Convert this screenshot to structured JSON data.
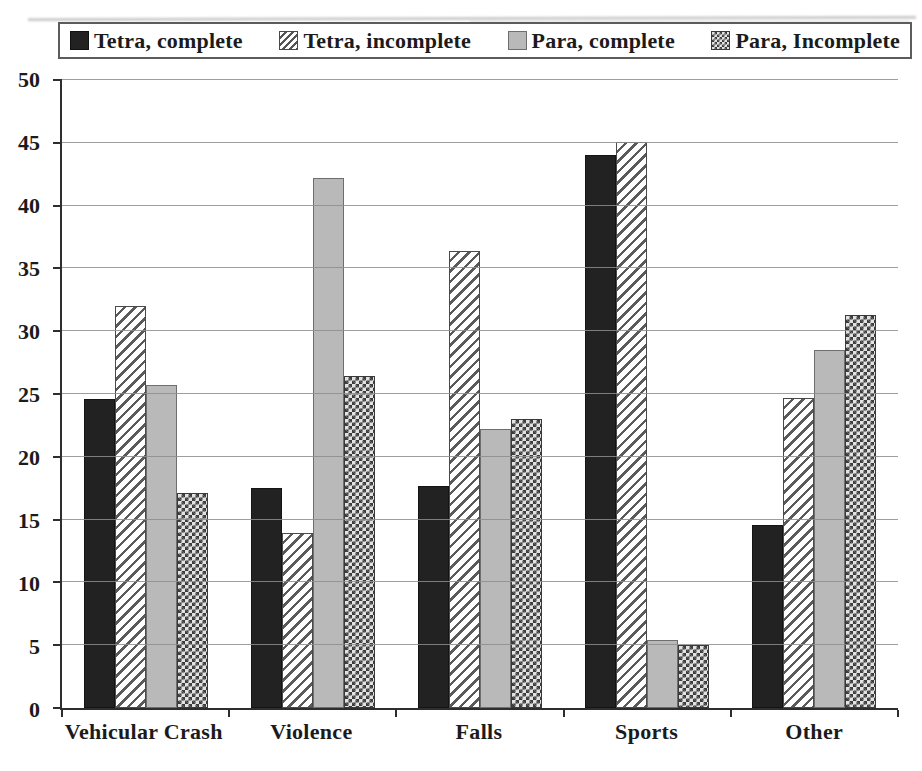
{
  "figure": {
    "background": "#ffffff",
    "kind": "scanned-grouped-bar-chart"
  },
  "colors": {
    "bar_solid": "#222222",
    "bar_hatch_line": "#5a5a5a",
    "bar_gray": "#b9b9b9",
    "bar_checker_dark": "#3c3c3c",
    "bar_checker_light": "#e2e2e2",
    "gridline": "#8d8d8d",
    "axis": "#2e2e2e",
    "text": "#1b1b1b",
    "legend_border": "#5c5c5c"
  },
  "chart_data": {
    "type": "bar",
    "title": "",
    "xlabel": "",
    "ylabel": "",
    "categories": [
      "Vehicular Crash",
      "Violence",
      "Falls",
      "Sports",
      "Other"
    ],
    "series": [
      {
        "name": "Tetra, complete",
        "pattern": "solid",
        "values": [
          24.6,
          17.5,
          17.7,
          44.0,
          14.6
        ]
      },
      {
        "name": "Tetra, incomplete",
        "pattern": "hatch",
        "values": [
          32.0,
          13.9,
          36.4,
          45.1,
          24.7
        ]
      },
      {
        "name": "Para, complete",
        "pattern": "gray",
        "values": [
          25.7,
          42.2,
          22.2,
          5.4,
          28.5
        ]
      },
      {
        "name": "Para, Incomplete",
        "pattern": "checker",
        "values": [
          17.1,
          26.4,
          23.0,
          5.0,
          31.3
        ]
      }
    ],
    "ylim": [
      0,
      50
    ],
    "ytick_step": 5,
    "yticks": [
      0,
      5,
      10,
      15,
      20,
      25,
      30,
      35,
      40,
      45,
      50
    ],
    "grid": true,
    "legend_position": "top"
  }
}
